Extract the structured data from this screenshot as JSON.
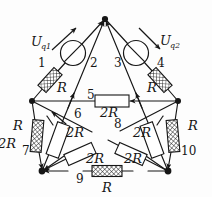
{
  "figure": {
    "background_color": "#fdfdfd",
    "line_color": "#161616"
  },
  "sources": [
    {
      "id": "Uq1",
      "label": "U",
      "sub": "q1",
      "name": "voltage-source-left"
    },
    {
      "id": "Uq2",
      "label": "U",
      "sub": "q2",
      "name": "voltage-source-right"
    }
  ],
  "branch_numbers": [
    {
      "id": "1",
      "label": "1"
    },
    {
      "id": "2",
      "label": "2"
    },
    {
      "id": "3",
      "label": "3"
    },
    {
      "id": "4",
      "label": "4"
    },
    {
      "id": "5",
      "label": "5"
    },
    {
      "id": "6",
      "label": "6"
    },
    {
      "id": "7",
      "label": "7"
    },
    {
      "id": "8",
      "label": "8"
    },
    {
      "id": "9",
      "label": "9"
    },
    {
      "id": "10",
      "label": "10"
    }
  ],
  "resistors": [
    {
      "id": "r1",
      "label": "R",
      "branch": "1",
      "style": "hatched"
    },
    {
      "id": "r4",
      "label": "R",
      "branch": "4",
      "style": "hatched"
    },
    {
      "id": "r5",
      "label": "2R",
      "branch": "5",
      "style": "plain"
    },
    {
      "id": "r6",
      "label": "2R",
      "branch": "6",
      "style": "plain"
    },
    {
      "id": "r7",
      "label": "R",
      "branch": "7",
      "style": "hatched"
    },
    {
      "id": "r8",
      "label": "2R",
      "branch": "8",
      "style": "plain"
    },
    {
      "id": "r9",
      "label": "R",
      "branch": "9",
      "style": "hatched"
    },
    {
      "id": "r10",
      "label": "R",
      "branch": "10",
      "style": "hatched"
    },
    {
      "id": "r_bl",
      "label": "2R",
      "branch": "9",
      "style": "plain"
    },
    {
      "id": "r_br",
      "label": "2R",
      "branch": "9",
      "style": "plain"
    }
  ],
  "labels": {
    "R": "R",
    "R2": "2R",
    "n1": "1",
    "n2": "2",
    "n3": "3",
    "n4": "4",
    "n5": "5",
    "n6": "6",
    "n7": "7",
    "n8": "8",
    "n9": "9",
    "n10": "10",
    "u": "U",
    "q1": "q1",
    "q2": "q2"
  },
  "nodes": [
    {
      "id": "top",
      "x": 105,
      "y": 19
    },
    {
      "id": "left",
      "x": 32,
      "y": 101
    },
    {
      "id": "right",
      "x": 178,
      "y": 101
    },
    {
      "id": "bottom-left",
      "x": 42,
      "y": 171
    },
    {
      "id": "bottom-right",
      "x": 168,
      "y": 171
    }
  ]
}
